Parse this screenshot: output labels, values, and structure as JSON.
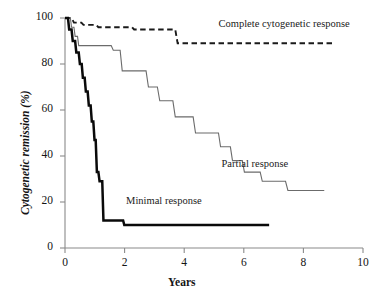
{
  "chart_data": {
    "type": "line",
    "title": "",
    "xlabel": "Years",
    "ylabel": "Cytogenetic remission (%)",
    "xlim": [
      0,
      10
    ],
    "ylim": [
      0,
      100
    ],
    "xticks": [
      0,
      2,
      4,
      6,
      8,
      10
    ],
    "yticks": [
      0,
      20,
      40,
      60,
      80,
      100
    ],
    "grid": false,
    "legend_position": "inline-annotations",
    "step_type": "post",
    "series": [
      {
        "name": "Complete cytogenetic response",
        "style": "dashed",
        "color": "#1a1a1a",
        "label_x": 5.15,
        "label_y": 97,
        "points": [
          [
            0.0,
            100
          ],
          [
            0.22,
            100
          ],
          [
            0.3,
            98
          ],
          [
            0.55,
            98
          ],
          [
            0.62,
            97
          ],
          [
            1.05,
            97
          ],
          [
            1.12,
            96
          ],
          [
            2.25,
            96
          ],
          [
            2.32,
            95
          ],
          [
            3.7,
            95
          ],
          [
            3.78,
            89
          ],
          [
            9.05,
            89
          ]
        ]
      },
      {
        "name": "Partial response",
        "style": "solid-thin",
        "color": "#6b6b6b",
        "label_x": 5.25,
        "label_y": 36,
        "points": [
          [
            0.0,
            100
          ],
          [
            0.18,
            100
          ],
          [
            0.22,
            96
          ],
          [
            0.3,
            96
          ],
          [
            0.34,
            92
          ],
          [
            0.42,
            92
          ],
          [
            0.46,
            88
          ],
          [
            1.55,
            88
          ],
          [
            1.62,
            86
          ],
          [
            1.85,
            86
          ],
          [
            1.92,
            77
          ],
          [
            2.72,
            77
          ],
          [
            2.8,
            70
          ],
          [
            3.1,
            70
          ],
          [
            3.18,
            64
          ],
          [
            3.62,
            64
          ],
          [
            3.7,
            57
          ],
          [
            4.3,
            57
          ],
          [
            4.38,
            50
          ],
          [
            5.15,
            50
          ],
          [
            5.22,
            44
          ],
          [
            5.55,
            44
          ],
          [
            5.62,
            38
          ],
          [
            5.95,
            38
          ],
          [
            6.02,
            33
          ],
          [
            6.55,
            33
          ],
          [
            6.62,
            29
          ],
          [
            7.4,
            29
          ],
          [
            7.48,
            25
          ],
          [
            8.7,
            25
          ]
        ]
      },
      {
        "name": "Minimal response",
        "style": "solid-thick",
        "color": "#0a0a0a",
        "label_x": 2.05,
        "label_y": 20,
        "points": [
          [
            0.0,
            100
          ],
          [
            0.1,
            100
          ],
          [
            0.14,
            95
          ],
          [
            0.22,
            95
          ],
          [
            0.26,
            90
          ],
          [
            0.34,
            90
          ],
          [
            0.38,
            85
          ],
          [
            0.46,
            85
          ],
          [
            0.5,
            80
          ],
          [
            0.56,
            80
          ],
          [
            0.6,
            74
          ],
          [
            0.66,
            74
          ],
          [
            0.7,
            68
          ],
          [
            0.76,
            68
          ],
          [
            0.8,
            62
          ],
          [
            0.86,
            62
          ],
          [
            0.9,
            55
          ],
          [
            0.95,
            55
          ],
          [
            0.99,
            47
          ],
          [
            1.03,
            47
          ],
          [
            1.07,
            33
          ],
          [
            1.12,
            33
          ],
          [
            1.16,
            29
          ],
          [
            1.25,
            29
          ],
          [
            1.29,
            12
          ],
          [
            1.95,
            12
          ],
          [
            1.99,
            10
          ],
          [
            6.85,
            10
          ]
        ]
      }
    ]
  },
  "axes": {
    "x_tick_labels": [
      "0",
      "2",
      "4",
      "6",
      "8",
      "10"
    ],
    "y_tick_labels": [
      "0",
      "20",
      "40",
      "60",
      "80",
      "100"
    ]
  }
}
